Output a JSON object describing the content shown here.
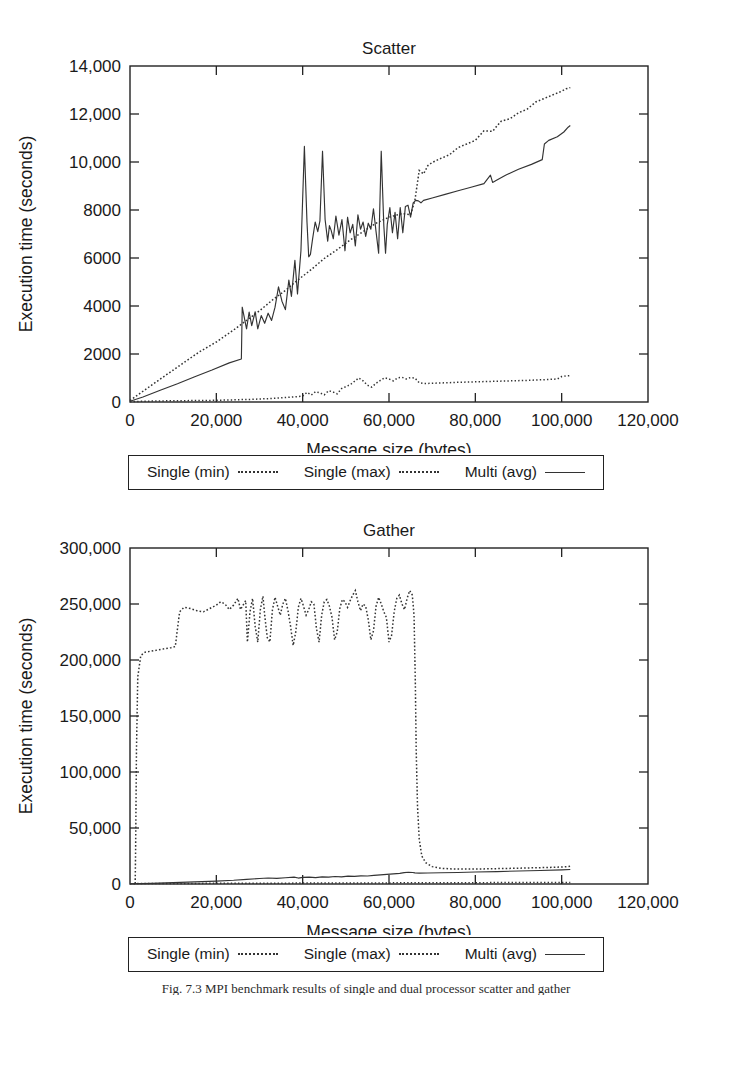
{
  "figure": {
    "caption": "Fig. 7.3   MPI benchmark results of single and dual processor scatter and gather"
  },
  "legend": {
    "entries": [
      {
        "label": "Single (min)",
        "style": "dotted"
      },
      {
        "label": "Single (max)",
        "style": "dotted"
      },
      {
        "label": "Multi (avg)",
        "style": "solid"
      }
    ]
  },
  "chart_data": [
    {
      "type": "line",
      "title": "Scatter",
      "xlabel": "Message size (bytes)",
      "ylabel": "Execution time (seconds)",
      "xlim": [
        0,
        120000
      ],
      "ylim": [
        0,
        14000
      ],
      "xticks": [
        0,
        20000,
        40000,
        60000,
        80000,
        100000,
        120000
      ],
      "xticklabels": [
        "0",
        "20,000",
        "40,000",
        "60,000",
        "80,000",
        "100,000",
        "120,000"
      ],
      "yticks": [
        0,
        2000,
        4000,
        6000,
        8000,
        10000,
        12000,
        14000
      ],
      "yticklabels": [
        "0",
        "2000",
        "4000",
        "6000",
        "8000",
        "10,000",
        "12,000",
        "14,000"
      ],
      "grid": false,
      "legend_position": "below",
      "series": [
        {
          "name": "Single (min)",
          "style": "dotted",
          "x": [
            0,
            1000,
            3000,
            6000,
            9000,
            12000,
            15000,
            18000,
            20000,
            22000,
            25000,
            28000,
            30000,
            32000,
            34000,
            36000,
            38000,
            40000,
            41000,
            42000,
            43000,
            44000,
            45000,
            46000,
            47000,
            48000,
            49000,
            50000,
            51000,
            52000,
            53000,
            54000,
            55000,
            56000,
            57000,
            58000,
            59000,
            60000,
            61000,
            62000,
            63000,
            64000,
            65000,
            66000,
            67000,
            68000,
            70000,
            73000,
            76000,
            80000,
            84000,
            88000,
            92000,
            96000,
            99000,
            100000,
            101000,
            102000
          ],
          "y": [
            10,
            20,
            30,
            40,
            50,
            55,
            60,
            65,
            70,
            80,
            95,
            110,
            125,
            140,
            160,
            185,
            210,
            250,
            400,
            290,
            430,
            380,
            300,
            470,
            420,
            340,
            560,
            640,
            720,
            860,
            1000,
            880,
            700,
            620,
            780,
            900,
            1010,
            960,
            880,
            1000,
            1030,
            960,
            1020,
            1000,
            800,
            770,
            780,
            800,
            820,
            840,
            860,
            880,
            900,
            930,
            960,
            1060,
            1090,
            1100
          ]
        },
        {
          "name": "Single (max)",
          "style": "dotted",
          "x": [
            0,
            2000,
            5000,
            8000,
            12000,
            16000,
            20000,
            24000,
            27000,
            30000,
            33000,
            36000,
            39000,
            42000,
            45000,
            48000,
            51000,
            54000,
            57000,
            60000,
            63000,
            65000,
            66000,
            67000,
            68000,
            69000,
            70000,
            72000,
            74000,
            76000,
            78000,
            80000,
            82000,
            84000,
            85000,
            86000,
            88000,
            90000,
            92000,
            94000,
            96000,
            98000,
            100000,
            101000,
            102000
          ],
          "y": [
            60,
            320,
            700,
            1080,
            1580,
            2080,
            2500,
            3000,
            3400,
            3800,
            4250,
            4650,
            5100,
            5520,
            5980,
            6350,
            6750,
            7100,
            7450,
            7700,
            7850,
            7800,
            8400,
            9650,
            9500,
            9850,
            9980,
            10150,
            10300,
            10600,
            10750,
            10900,
            11300,
            11280,
            11500,
            11700,
            11800,
            12050,
            12200,
            12500,
            12650,
            12800,
            12950,
            13050,
            13100
          ]
        },
        {
          "name": "Multi (avg)",
          "style": "solid",
          "x": [
            0,
            3000,
            7000,
            11000,
            15000,
            19000,
            23000,
            25800,
            26000,
            27000,
            27600,
            28200,
            29000,
            29600,
            30400,
            31200,
            32000,
            32800,
            33600,
            34400,
            35200,
            36000,
            36800,
            37400,
            38200,
            38800,
            39600,
            40400,
            41000,
            41400,
            41800,
            42300,
            42900,
            43500,
            44000,
            44600,
            45200,
            45800,
            46200,
            46600,
            47100,
            47700,
            48400,
            49100,
            49800,
            50400,
            51000,
            51600,
            52200,
            52800,
            53400,
            54000,
            54600,
            55200,
            55800,
            56400,
            57000,
            57600,
            58200,
            58800,
            59200,
            59600,
            60200,
            60800,
            61400,
            62000,
            62600,
            63200,
            63800,
            64400,
            65000,
            65600,
            66200,
            66800,
            67400,
            68000,
            70000,
            73000,
            76000,
            79000,
            82000,
            83500,
            84000,
            85000,
            87000,
            90000,
            93000,
            95500,
            96000,
            97000,
            99000,
            100500,
            101500,
            102000
          ],
          "y": [
            30,
            210,
            490,
            760,
            1050,
            1330,
            1630,
            1790,
            3950,
            3050,
            3750,
            3180,
            3760,
            3050,
            3600,
            3280,
            3700,
            3400,
            3950,
            4800,
            4200,
            3850,
            5080,
            4400,
            5900,
            4500,
            6300,
            10650,
            7500,
            6050,
            6150,
            6800,
            7500,
            7100,
            7550,
            10450,
            7600,
            6700,
            7350,
            7150,
            6800,
            7750,
            6950,
            7600,
            6300,
            7700,
            7050,
            7400,
            6500,
            7800,
            7200,
            7500,
            6900,
            7450,
            7200,
            8050,
            7100,
            6200,
            10450,
            7350,
            6200,
            7400,
            8100,
            7050,
            7900,
            6800,
            8100,
            7050,
            8150,
            8200,
            7700,
            8300,
            8400,
            8380,
            8300,
            8400,
            8500,
            8650,
            8800,
            8950,
            9100,
            9450,
            9150,
            9250,
            9450,
            9700,
            9900,
            10100,
            10750,
            10900,
            11050,
            11250,
            11450,
            11520
          ]
        }
      ]
    },
    {
      "type": "line",
      "title": "Gather",
      "xlabel": "Message size (bytes)",
      "ylabel": "Execution time (seconds)",
      "xlim": [
        0,
        120000
      ],
      "ylim": [
        0,
        300000
      ],
      "xticks": [
        0,
        20000,
        40000,
        60000,
        80000,
        100000,
        120000
      ],
      "xticklabels": [
        "0",
        "20,000",
        "40,000",
        "60,000",
        "80,000",
        "100,000",
        "120,000"
      ],
      "yticks": [
        0,
        50000,
        100000,
        150000,
        200000,
        250000,
        300000
      ],
      "yticklabels": [
        "0",
        "50,000",
        "100,000",
        "150,000",
        "200,000",
        "250,000",
        "300,000"
      ],
      "grid": false,
      "legend_position": "below",
      "series": [
        {
          "name": "Single (min)",
          "style": "dotted",
          "x": [
            0,
            5000,
            20000,
            40000,
            60000,
            80000,
            100000,
            102000
          ],
          "y": [
            300,
            400,
            600,
            800,
            1000,
            1200,
            1400,
            1450
          ]
        },
        {
          "name": "Single (max)",
          "style": "dotted",
          "x": [
            1200,
            1300,
            1500,
            1800,
            2500,
            3500,
            5000,
            6500,
            8000,
            9500,
            10500,
            11000,
            11500,
            12500,
            14000,
            15500,
            17000,
            18500,
            20000,
            21000,
            22000,
            23000,
            24000,
            25000,
            25600,
            26200,
            26800,
            27200,
            27800,
            28400,
            29000,
            29600,
            30200,
            30800,
            31200,
            31800,
            32400,
            33000,
            33600,
            34200,
            34800,
            35400,
            36000,
            36600,
            37200,
            37800,
            38400,
            39000,
            39600,
            40200,
            40800,
            41400,
            42000,
            42600,
            43200,
            43800,
            44400,
            45000,
            45600,
            46200,
            46800,
            47400,
            48000,
            48600,
            49200,
            49800,
            50400,
            51000,
            51600,
            52200,
            52800,
            53400,
            54000,
            54600,
            55200,
            55800,
            56400,
            57000,
            57600,
            58200,
            58800,
            59400,
            60000,
            60600,
            61200,
            61800,
            62400,
            63000,
            63600,
            64200,
            64800,
            65400,
            65800,
            66100,
            66300,
            66600,
            67000,
            67600,
            68500,
            70000,
            72000,
            75000,
            78000,
            82000,
            86000,
            90000,
            94000,
            98000,
            100500,
            101500,
            102000
          ],
          "y": [
            300,
            30000,
            120000,
            185000,
            204000,
            207000,
            208000,
            209000,
            210000,
            211000,
            212000,
            228000,
            243000,
            247000,
            246000,
            244000,
            243000,
            246000,
            249000,
            252000,
            250000,
            245000,
            249000,
            255000,
            245000,
            249000,
            253000,
            216000,
            243000,
            255000,
            230000,
            216000,
            245000,
            257000,
            240000,
            220000,
            216000,
            245000,
            256000,
            248000,
            240000,
            250000,
            255000,
            244000,
            230000,
            213000,
            225000,
            247000,
            255000,
            248000,
            240000,
            245000,
            252000,
            250000,
            228000,
            216000,
            240000,
            252000,
            254000,
            248000,
            238000,
            218000,
            225000,
            246000,
            254000,
            252000,
            247000,
            253000,
            258000,
            262000,
            252000,
            244000,
            250000,
            248000,
            236000,
            218000,
            226000,
            248000,
            256000,
            250000,
            243000,
            238000,
            216000,
            222000,
            243000,
            255000,
            258000,
            250000,
            245000,
            255000,
            262000,
            258000,
            240000,
            180000,
            120000,
            70000,
            40000,
            25000,
            19000,
            15500,
            14000,
            13400,
            13300,
            13500,
            13800,
            14100,
            14500,
            14900,
            15300,
            15600,
            15800
          ]
        },
        {
          "name": "Multi (avg)",
          "style": "solid",
          "x": [
            0,
            5000,
            10000,
            15000,
            20000,
            24000,
            27000,
            30000,
            32000,
            34000,
            36000,
            38000,
            39000,
            40000,
            41500,
            43000,
            44500,
            46000,
            47500,
            49000,
            50500,
            52000,
            53500,
            55000,
            56500,
            58000,
            59500,
            61000,
            62500,
            63500,
            64500,
            65500,
            66000,
            67000,
            69000,
            72000,
            76000,
            80000,
            85000,
            90000,
            95000,
            100000,
            102000
          ],
          "y": [
            200,
            600,
            1200,
            1900,
            2600,
            3300,
            4100,
            4900,
            5400,
            5000,
            5600,
            6100,
            5300,
            5900,
            6200,
            5700,
            6400,
            6100,
            6700,
            6400,
            7000,
            6800,
            7300,
            7100,
            7700,
            8200,
            8600,
            9100,
            9500,
            10100,
            10500,
            10300,
            9900,
            9700,
            9800,
            10000,
            10300,
            10700,
            11100,
            11600,
            12100,
            12600,
            12900
          ]
        }
      ]
    }
  ]
}
